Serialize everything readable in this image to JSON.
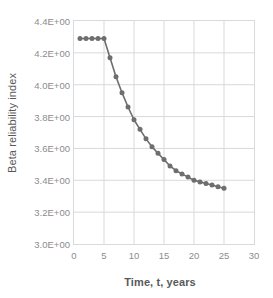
{
  "chart_data": {
    "type": "line",
    "title": "",
    "subtitle": "",
    "xlabel": "Time, t, years",
    "ylabel": "Beta reliability index",
    "xlim": [
      0,
      30
    ],
    "ylim": [
      3.0,
      4.4
    ],
    "xticks": [
      "0",
      "5",
      "10",
      "15",
      "20",
      "25",
      "30"
    ],
    "xtick_values": [
      0,
      5,
      10,
      15,
      20,
      25,
      30
    ],
    "yticks": [
      "3.0E+00",
      "3.2E+00",
      "3.4E+00",
      "3.6E+00",
      "3.8E+00",
      "4.0E+00",
      "4.2E+00",
      "4.4E+00"
    ],
    "ytick_values": [
      3.0,
      3.2,
      3.4,
      3.6,
      3.8,
      4.0,
      4.2,
      4.4
    ],
    "grid": true,
    "grid_color": "#d9d9d9",
    "legend": false,
    "legend_position": "none",
    "marker": "circle",
    "marker_size": 5,
    "series": [
      {
        "name": "Beta reliability index",
        "color": "#6e6e6e",
        "x": [
          1,
          2,
          3,
          4,
          5,
          6,
          7,
          8,
          9,
          10,
          11,
          12,
          13,
          14,
          15,
          16,
          17,
          18,
          19,
          20,
          21,
          22,
          23,
          24,
          25
        ],
        "values": [
          4.29,
          4.29,
          4.29,
          4.29,
          4.29,
          4.17,
          4.05,
          3.95,
          3.86,
          3.78,
          3.72,
          3.66,
          3.61,
          3.57,
          3.53,
          3.49,
          3.46,
          3.44,
          3.42,
          3.4,
          3.39,
          3.38,
          3.37,
          3.36,
          3.35
        ]
      }
    ]
  },
  "axes": {
    "y_label": "Beta reliability index",
    "x_label": "Time, t, years"
  },
  "colors": {
    "series": "#6e6e6e",
    "grid": "#d9d9d9",
    "tick_text": "#8c8c8c",
    "axis_label_text": "#595959",
    "plot_background": "#ffffff"
  }
}
